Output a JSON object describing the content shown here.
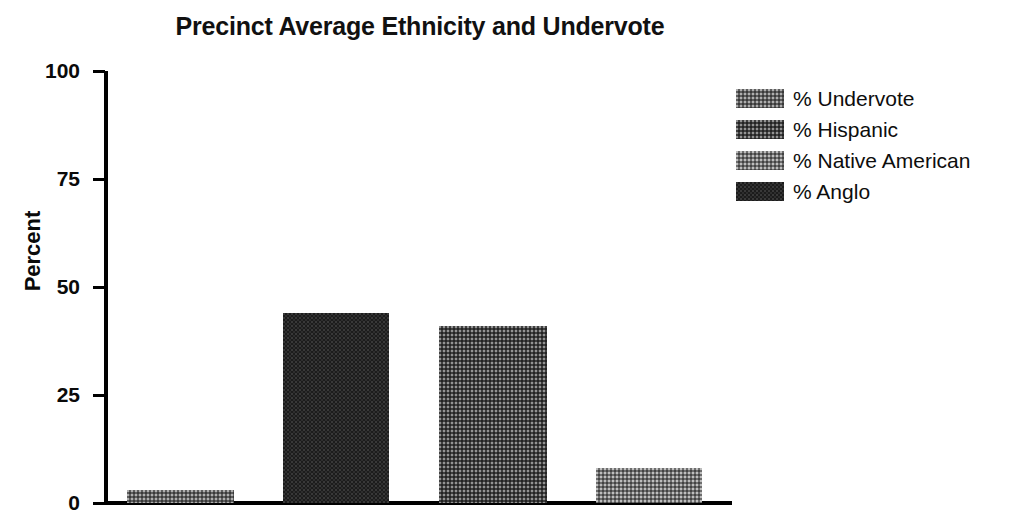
{
  "chart_data": {
    "type": "bar",
    "title": "Precinct Average Ethnicity and Undervote",
    "xlabel": "",
    "ylabel": "Percent",
    "ylim": [
      0,
      100
    ],
    "yticks": [
      0,
      25,
      50,
      75,
      100
    ],
    "ytick_labels": [
      "0",
      "25",
      "50",
      "75",
      "100"
    ],
    "grid": false,
    "legend_position": "right",
    "categories": [
      "% Undervote",
      "% Anglo",
      "% Hispanic",
      "% Native American"
    ],
    "values": [
      3,
      44,
      41,
      8
    ],
    "bars": [
      {
        "label": "% Undervote",
        "value": 3,
        "fill": "fill-medlight",
        "swatch_class": "fill-medlight"
      },
      {
        "label": "% Anglo",
        "value": 44,
        "fill": "fill-dark",
        "swatch_class": "fill-dark"
      },
      {
        "label": "% Hispanic",
        "value": 41,
        "fill": "fill-mid",
        "swatch_class": "fill-mid"
      },
      {
        "label": "% Native American",
        "value": 8,
        "fill": "fill-light",
        "swatch_class": "fill-light"
      }
    ],
    "legend": [
      {
        "label": "% Undervote",
        "swatch_class": "fill-medlight"
      },
      {
        "label": "% Hispanic",
        "swatch_class": "fill-mid"
      },
      {
        "label": "% Native American",
        "swatch_class": "fill-light"
      },
      {
        "label": "% Anglo",
        "swatch_class": "fill-dark"
      }
    ],
    "colors": {
      "anglo": "#1c1c1c",
      "hispanic": "#3f3f3f",
      "native_american": "#6e6e6e",
      "undervote": "#5d5d5d",
      "axis": "#000000",
      "text": "#0a0a0a",
      "background": "#ffffff"
    }
  }
}
